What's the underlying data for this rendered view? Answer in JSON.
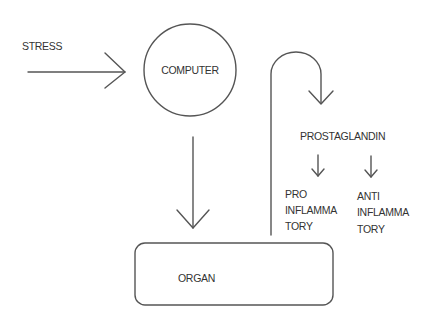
{
  "diagram": {
    "nodes": {
      "stress": {
        "label": "STRESS"
      },
      "computer": {
        "label": "COMPUTER",
        "shape": "circle"
      },
      "organ": {
        "label": "ORGAN",
        "shape": "rounded-rectangle"
      },
      "prostaglandin": {
        "label": "PROSTAGLANDIN"
      },
      "pro_inflammatory": {
        "lines": [
          "PRO",
          "INFLAMMA",
          "TORY"
        ]
      },
      "anti_inflammatory": {
        "lines": [
          "ANTI",
          "INFLAMMA",
          "TORY"
        ]
      }
    },
    "edges": [
      {
        "from": "STRESS",
        "to": "COMPUTER"
      },
      {
        "from": "COMPUTER",
        "to": "ORGAN"
      },
      {
        "from": "ORGAN",
        "to": "PROSTAGLANDIN"
      },
      {
        "from": "PROSTAGLANDIN",
        "to": "PRO INFLAMMATORY"
      },
      {
        "from": "PROSTAGLANDIN",
        "to": "ANTI INFLAMMATORY"
      }
    ],
    "colors": {
      "stroke": "#555555",
      "text": "#333333",
      "background": "#ffffff"
    }
  }
}
